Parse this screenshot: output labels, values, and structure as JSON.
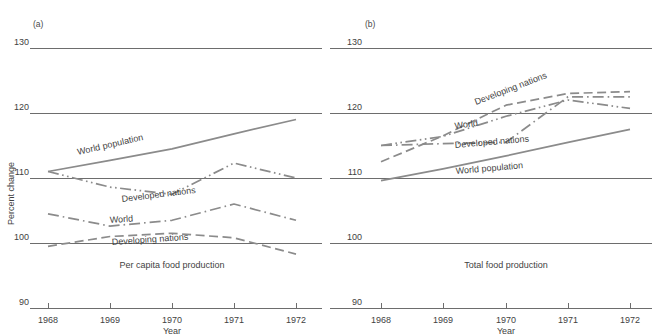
{
  "figure": {
    "panels": [
      {
        "tag": "(a)",
        "caption": "Per capita food production",
        "xlabel": "Year",
        "ylabel": "Percent change"
      },
      {
        "tag": "(b)",
        "caption": "Total food production",
        "xlabel": "Year",
        "ylabel": ""
      }
    ]
  },
  "chart_data": [
    {
      "type": "line",
      "title": "Per capita food production",
      "panel": "(a)",
      "xlabel": "Year",
      "ylabel": "Percent change",
      "x": [
        1968,
        1969,
        1970,
        1971,
        1972
      ],
      "xticklabels": [
        "1968",
        "1969",
        "1970",
        "1971",
        "1972"
      ],
      "ylim": [
        90,
        130
      ],
      "yticks": [
        90,
        100,
        110,
        120,
        130
      ],
      "yticklabels": [
        "90",
        "100",
        "110",
        "120",
        "130"
      ],
      "grid": true,
      "legend": "inline-labels",
      "series": [
        {
          "name": "World population",
          "values": [
            111.0,
            112.7,
            114.5,
            116.8,
            119.0
          ],
          "style": "solid",
          "color": "#8b8b8b"
        },
        {
          "name": "Developed nations",
          "values": [
            111.0,
            108.6,
            107.5,
            112.3,
            110.0
          ],
          "style": "dash-dot-dot",
          "color": "#8b8b8b"
        },
        {
          "name": "World",
          "values": [
            104.5,
            102.6,
            103.5,
            106.0,
            103.5
          ],
          "style": "dash-dot",
          "color": "#8b8b8b"
        },
        {
          "name": "Developing nations",
          "values": [
            99.5,
            101.0,
            101.5,
            100.8,
            98.3
          ],
          "style": "dashed",
          "color": "#8b8b8b"
        }
      ]
    },
    {
      "type": "line",
      "title": "Total food production",
      "panel": "(b)",
      "xlabel": "Year",
      "ylabel": "",
      "x": [
        1968,
        1969,
        1970,
        1971,
        1972
      ],
      "xticklabels": [
        "1968",
        "1969",
        "1970",
        "1971",
        "1972"
      ],
      "ylim": [
        90,
        130
      ],
      "yticks": [
        90,
        100,
        110,
        120,
        130
      ],
      "yticklabels": [
        "90",
        "100",
        "110",
        "120",
        "130"
      ],
      "grid": true,
      "legend": "inline-labels",
      "series": [
        {
          "name": "Developing nations",
          "values": [
            112.5,
            116.5,
            121.2,
            123.0,
            123.3
          ],
          "style": "dashed",
          "color": "#8b8b8b"
        },
        {
          "name": "World",
          "values": [
            115.0,
            116.4,
            119.5,
            122.0,
            120.7
          ],
          "style": "dash-dot-dot",
          "color": "#8b8b8b"
        },
        {
          "name": "Developed nations",
          "values": [
            115.0,
            115.3,
            115.5,
            122.5,
            122.5
          ],
          "style": "dash-dot",
          "color": "#8b8b8b"
        },
        {
          "name": "World population",
          "values": [
            109.6,
            111.4,
            113.4,
            115.5,
            117.5
          ],
          "style": "solid",
          "color": "#8b8b8b"
        }
      ]
    }
  ],
  "series_labels": {
    "a_world_population": "World population",
    "a_developed_nations": "Developed nations",
    "a_world": "World",
    "a_developing_nations": "Developing  nations",
    "b_developing_nations": "Developing  nations",
    "b_world": "World",
    "b_developed_nations": "Developed nations",
    "b_world_population": "World population"
  },
  "ticks": {
    "y": [
      "130",
      "120",
      "110",
      "100",
      "90"
    ],
    "x": [
      "1968",
      "1969",
      "1970",
      "1971",
      "1972"
    ]
  }
}
